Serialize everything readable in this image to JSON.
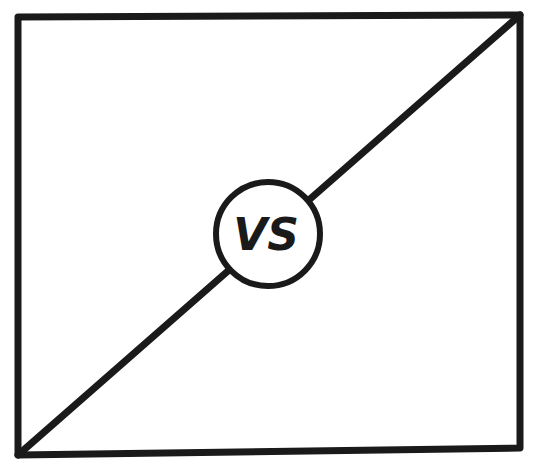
{
  "diagram": {
    "type": "versus-split-panel",
    "center_label": "VS",
    "stroke_color": "#1a1a1a",
    "background_color": "#ffffff",
    "frame": {
      "top_left": [
        18,
        17
      ],
      "top_right": [
        520,
        15
      ],
      "bottom_right": [
        520,
        448
      ],
      "bottom_left": [
        18,
        455
      ]
    },
    "divider": {
      "from": [
        18,
        455
      ],
      "to": [
        520,
        15
      ]
    },
    "badge": {
      "center": [
        268,
        234
      ],
      "radius": 52
    }
  }
}
